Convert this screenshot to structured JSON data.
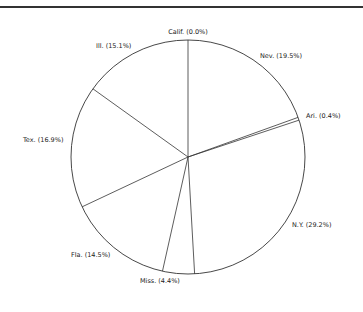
{
  "chart_data": {
    "type": "pie",
    "title": "",
    "start_angle_deg": 0,
    "direction": "clockwise",
    "center": [
      188,
      157
    ],
    "radius": 117,
    "slices": [
      {
        "label": "Calif.",
        "value": 0.0,
        "text": "Calif. (0.0%)",
        "lx": 188,
        "ly": 34,
        "anchor": "middle"
      },
      {
        "label": "Nev.",
        "value": 19.5,
        "text": "Nev. (19.5%)",
        "lx": 260,
        "ly": 58,
        "anchor": "start"
      },
      {
        "label": "Ari.",
        "value": 0.4,
        "text": "Ari. (0.4%)",
        "lx": 306,
        "ly": 118,
        "anchor": "start"
      },
      {
        "label": "N.Y.",
        "value": 29.2,
        "text": "N.Y. (29.2%)",
        "lx": 292,
        "ly": 227,
        "anchor": "start"
      },
      {
        "label": "Miss.",
        "value": 4.4,
        "text": "Miss. (4.4%)",
        "lx": 140,
        "ly": 283,
        "anchor": "start"
      },
      {
        "label": "Fla.",
        "value": 14.5,
        "text": "Fla. (14.5%)",
        "lx": 71,
        "ly": 257,
        "anchor": "start"
      },
      {
        "label": "Tex.",
        "value": 16.9,
        "text": "Tex. (16.9%)",
        "lx": 23,
        "ly": 142,
        "anchor": "start"
      },
      {
        "label": "Ill.",
        "value": 15.1,
        "text": "Ill. (15.1%)",
        "lx": 96,
        "ly": 48,
        "anchor": "start"
      }
    ],
    "legend": "none",
    "grid": false
  }
}
